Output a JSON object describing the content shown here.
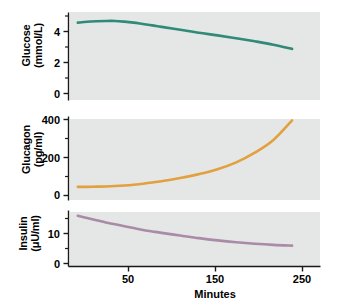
{
  "figure": {
    "background": "#ffffff",
    "panel_background": "#e4e7e6",
    "axis_color": "#1a1a1a",
    "xaxis_title": "Minutes"
  },
  "chart_data": [
    {
      "type": "line",
      "title": "",
      "panel": "glucose",
      "xlabel": "Minutes",
      "ylabel": "Glucose (mmol/L)",
      "ylabel_line1": "Glucose",
      "ylabel_line2": "(mmol/L)",
      "series_name": "Glucose",
      "color": "#2f8a78",
      "grid": false,
      "legend": "none",
      "xlim": [
        0,
        270
      ],
      "ylim": [
        0,
        5.2
      ],
      "xticks": [
        50,
        150,
        250
      ],
      "yticks": [
        0,
        2,
        4
      ],
      "ytick_labels": [
        "0",
        "2",
        "4"
      ],
      "yminor_ticks": [
        1,
        3,
        5
      ],
      "x": [
        10,
        20,
        30,
        40,
        50,
        60,
        70,
        80,
        90,
        100,
        120,
        140,
        160,
        180,
        200,
        220,
        240
      ],
      "values": [
        4.6,
        4.65,
        4.68,
        4.7,
        4.7,
        4.66,
        4.6,
        4.52,
        4.44,
        4.35,
        4.18,
        4.0,
        3.85,
        3.68,
        3.5,
        3.3,
        3.05
      ]
    },
    {
      "type": "line",
      "title": "",
      "panel": "glucagon",
      "xlabel": "Minutes",
      "ylabel": "Glucagon (pg/ml)",
      "ylabel_line1": "Glucagon",
      "ylabel_line2": "(pg/ml)",
      "series_name": "Glucagon",
      "color": "#e2a03f",
      "grid": false,
      "legend": "none",
      "xlim": [
        0,
        270
      ],
      "ylim": [
        0,
        430
      ],
      "xticks": [
        50,
        150,
        250
      ],
      "yticks": [
        0,
        200,
        400
      ],
      "ytick_labels": [
        "0",
        "200",
        "400"
      ],
      "yminor_ticks": [
        100,
        300
      ],
      "x": [
        10,
        20,
        30,
        40,
        50,
        60,
        70,
        80,
        90,
        100,
        120,
        140,
        160,
        180,
        200,
        220,
        240
      ],
      "values": [
        70,
        70,
        71,
        72,
        74,
        77,
        81,
        86,
        92,
        99,
        115,
        135,
        160,
        195,
        245,
        310,
        410
      ]
    },
    {
      "type": "line",
      "title": "",
      "panel": "insulin",
      "xlabel": "Minutes",
      "ylabel": "Insulin (μU/ml)",
      "ylabel_line1": "Insulin",
      "ylabel_line2": "(μU/ml)",
      "series_name": "Insulin",
      "color": "#a98ba8",
      "grid": false,
      "legend": "none",
      "xlim": [
        0,
        270
      ],
      "ylim": [
        0,
        15
      ],
      "xticks": [
        50,
        150,
        250
      ],
      "yticks": [
        0,
        10
      ],
      "ytick_labels": [
        "0",
        "10"
      ],
      "yminor_ticks": [
        5,
        15
      ],
      "x": [
        10,
        20,
        30,
        40,
        50,
        60,
        70,
        80,
        90,
        100,
        120,
        140,
        160,
        180,
        200,
        220,
        240
      ],
      "values": [
        13.6,
        13.0,
        12.4,
        11.8,
        11.3,
        10.8,
        10.3,
        9.8,
        9.4,
        9.0,
        8.3,
        7.6,
        7.0,
        6.5,
        6.1,
        5.8,
        5.6
      ]
    }
  ],
  "xaxis": {
    "title": "Minutes",
    "tick_labels": [
      "50",
      "150",
      "250"
    ],
    "tick_values": [
      50,
      150,
      250
    ]
  }
}
